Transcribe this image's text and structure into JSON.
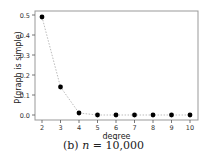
{
  "chart_data": {
    "type": "scatter",
    "title": "",
    "xlabel": "degree",
    "ylabel": "P(graph is simple)",
    "x": [
      2,
      3,
      4,
      5,
      6,
      7,
      8,
      9,
      10
    ],
    "series": [
      {
        "name": "P(graph is simple)",
        "values": [
          0.49,
          0.14,
          0.01,
          0.0,
          0.0,
          0.0,
          0.0,
          0.0,
          0.0
        ],
        "marker": "circle",
        "color": "#000000",
        "line": "dotted",
        "line_color": "#bbbbbb"
      }
    ],
    "xticks": [
      "2",
      "3",
      "4",
      "5",
      "6",
      "7",
      "8",
      "9",
      "10"
    ],
    "yticks": [
      "0.0",
      "0.1",
      "0.2",
      "0.3",
      "0.4",
      "0.5"
    ],
    "xlim": [
      1.8,
      10.3
    ],
    "ylim": [
      -0.02,
      0.52
    ],
    "grid": false,
    "legend": null
  },
  "caption": {
    "label": "(b)",
    "variable": "n",
    "equals": "=",
    "value": "10,000"
  }
}
